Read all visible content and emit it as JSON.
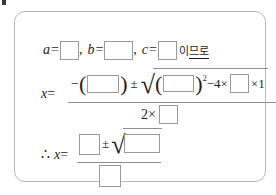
{
  "top_strip": {
    "bullet": "square-bullet",
    "clipped_text": ""
  },
  "panel": {
    "border_color": "#b9b9b9",
    "background": "#ffffff"
  },
  "line1": {
    "var_a": "a",
    "eq": "=",
    "comma": ",",
    "var_b": "b",
    "var_c": "c",
    "since_text": "이",
    "since_text_underlined": "므로",
    "blanks": [
      "",
      "",
      ""
    ]
  },
  "line2": {
    "lhs": "x",
    "eq": "=",
    "numerator": {
      "minus": "−",
      "lparen": "(",
      "rparen": ")",
      "blank_b": "",
      "pm": "±",
      "radical_sign": "√",
      "rad_lparen": "(",
      "rad_rparen": ")",
      "blank_b2": "",
      "superscript": "2",
      "minus2": "−",
      "four": "4",
      "times1": "×",
      "blank_a": "",
      "times2": "×",
      "one": "1"
    },
    "denominator": {
      "two": "2",
      "times": "×",
      "blank_a": ""
    }
  },
  "line3": {
    "therefore": "∴",
    "lhs": "x",
    "eq": "=",
    "numerator": {
      "blank_left": "",
      "pm": "±",
      "radical_sign": "√",
      "blank_radicand": ""
    },
    "denominator": {
      "blank_bottom": ""
    }
  },
  "colors": {
    "text": "#1d1d1d",
    "blank_border": "#9a9a9a",
    "rule": "#8f8f8f",
    "panel_border": "#b9b9b9"
  }
}
